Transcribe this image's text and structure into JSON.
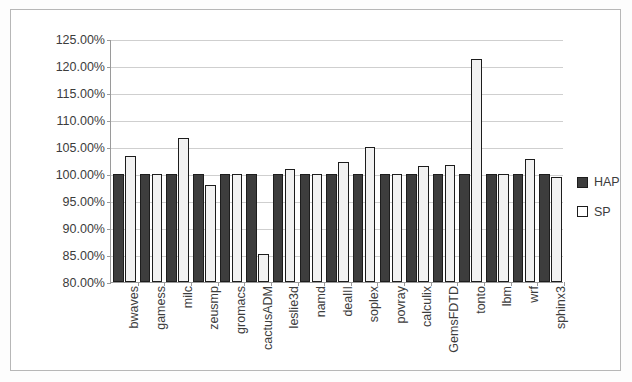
{
  "chart_data": {
    "type": "bar",
    "title": "",
    "subtitle": "",
    "xlabel": "",
    "ylabel": "",
    "grid": true,
    "legend_position": "right",
    "ylim": [
      80,
      125
    ],
    "ytick_step": 5,
    "ytick_labels": [
      "125.00%",
      "120.00%",
      "115.00%",
      "110.00%",
      "105.00%",
      "100.00%",
      "95.00%",
      "90.00%",
      "85.00%",
      "80.00%"
    ],
    "ytick_values": [
      125,
      120,
      115,
      110,
      105,
      100,
      95,
      90,
      85,
      80
    ],
    "categories": [
      "bwaves",
      "gamess",
      "milc",
      "zeusmp",
      "gromacs",
      "cactusADM",
      "leslie3d",
      "namd",
      "dealII",
      "soplex",
      "povray",
      "calculix",
      "GemsFDTD",
      "tonto",
      "lbm",
      "wrf",
      "sphinx3"
    ],
    "series": [
      {
        "name": "HAP",
        "color": "#3d3d3d",
        "values": [
          100.0,
          100.0,
          100.0,
          100.0,
          100.0,
          100.0,
          100.0,
          100.0,
          100.0,
          100.0,
          100.0,
          100.0,
          100.0,
          100.0,
          100.0,
          100.0,
          100.0
        ]
      },
      {
        "name": "SP",
        "color": "#f2f2f2",
        "values": [
          103.3,
          100.0,
          106.7,
          97.9,
          100.0,
          85.2,
          101.0,
          100.0,
          102.2,
          105.0,
          100.0,
          101.5,
          101.6,
          121.3,
          100.0,
          102.8,
          99.4
        ]
      }
    ]
  },
  "legend": {
    "items": [
      {
        "label": "HAP",
        "swatch": "dark-square-swatch"
      },
      {
        "label": "SP",
        "swatch": "light-square-swatch"
      }
    ]
  }
}
